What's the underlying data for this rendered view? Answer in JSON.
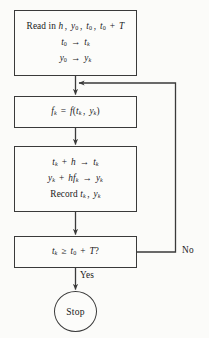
{
  "diagram": {
    "stroke_color": "#3a3a3a",
    "background_color": "#fbfbf9",
    "text_color": "#1a1a1a",
    "nodes": [
      {
        "id": "read-in",
        "shape": "rectangle",
        "lines": [
          "Read in h, y₀, t₀, t₀ + T",
          "t₀ → tₖ",
          "y₀ → yₖ"
        ]
      },
      {
        "id": "evaluate-f",
        "shape": "rectangle",
        "lines": [
          "fₖ = f(tₖ, yₖ)"
        ]
      },
      {
        "id": "update-step",
        "shape": "rectangle",
        "lines": [
          "tₖ + h → tₖ",
          "yₖ + hfₖ → yₖ",
          "Record tₖ, yₖ"
        ]
      },
      {
        "id": "test-condition",
        "shape": "rectangle",
        "lines": [
          "tₖ ≥ t₀ + T?"
        ]
      },
      {
        "id": "stop",
        "shape": "ellipse",
        "lines": [
          "Stop"
        ]
      }
    ],
    "edge_labels": {
      "no": "No",
      "yes": "Yes"
    }
  }
}
